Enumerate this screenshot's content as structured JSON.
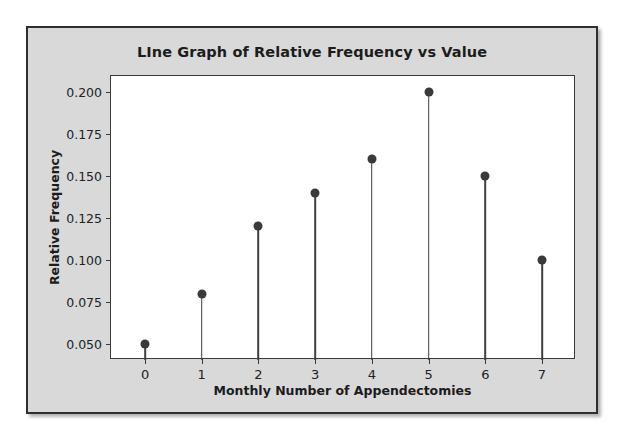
{
  "chart_data": {
    "type": "line",
    "title": "LIne Graph of Relative Frequency vs Value",
    "xlabel": "Monthly Number of Appendectomies",
    "ylabel": "Relative Frequency",
    "x": [
      0,
      1,
      2,
      3,
      4,
      5,
      6,
      7
    ],
    "values": [
      0.05,
      0.08,
      0.12,
      0.14,
      0.16,
      0.2,
      0.15,
      0.1
    ],
    "series": [
      {
        "name": "Relative Frequency",
        "values": [
          0.05,
          0.08,
          0.12,
          0.14,
          0.16,
          0.2,
          0.15,
          0.1
        ]
      }
    ],
    "xtick_labels": [
      "0",
      "1",
      "2",
      "3",
      "4",
      "5",
      "6",
      "7"
    ],
    "ytick_labels": [
      "0.050",
      "0.075",
      "0.100",
      "0.125",
      "0.150",
      "0.175",
      "0.200"
    ],
    "ytick_values": [
      0.05,
      0.075,
      0.1,
      0.125,
      0.15,
      0.175,
      0.2
    ],
    "xlim": [
      -0.6,
      7.6
    ],
    "ylim": [
      0.0405,
      0.2095
    ],
    "grid": false,
    "legend": null,
    "marker": "filled-circle",
    "marker_color": "#3a3a3a",
    "stem_color": "#3f3f3f",
    "plot_background": "#ffffff",
    "figure_background": "#d9d9d9"
  }
}
